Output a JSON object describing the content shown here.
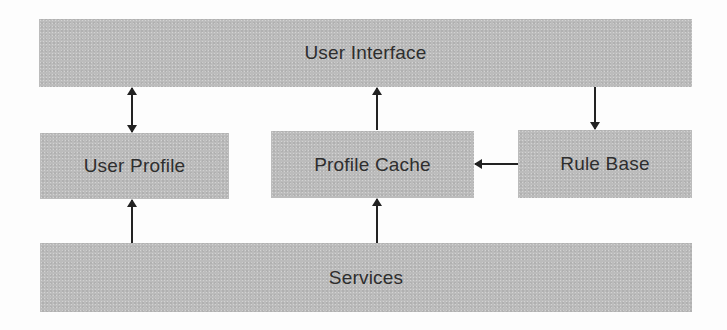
{
  "diagram": {
    "title": "",
    "colors": {
      "box_fill": "#bcbcbc",
      "text": "#2e2e2e",
      "arrow": "#222222",
      "background": "#fdfdfd"
    },
    "nodes": [
      {
        "id": "user_interface",
        "label": "User Interface"
      },
      {
        "id": "user_profile",
        "label": "User Profile"
      },
      {
        "id": "profile_cache",
        "label": "Profile Cache"
      },
      {
        "id": "rule_base",
        "label": "Rule Base"
      },
      {
        "id": "services",
        "label": "Services"
      }
    ],
    "edges": [
      {
        "from": "user_interface",
        "to": "user_profile",
        "direction": "bidirectional"
      },
      {
        "from": "profile_cache",
        "to": "user_interface",
        "direction": "forward"
      },
      {
        "from": "user_interface",
        "to": "rule_base",
        "direction": "forward"
      },
      {
        "from": "rule_base",
        "to": "profile_cache",
        "direction": "forward"
      },
      {
        "from": "services",
        "to": "user_profile",
        "direction": "forward"
      },
      {
        "from": "services",
        "to": "profile_cache",
        "direction": "forward"
      }
    ]
  }
}
